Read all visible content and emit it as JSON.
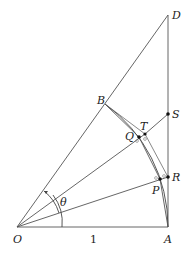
{
  "diagram": {
    "type": "geometry",
    "points": [
      {
        "name": "O",
        "label": "O",
        "x": 17,
        "y": 227
      },
      {
        "name": "A",
        "label": "A",
        "x": 168,
        "y": 227
      },
      {
        "name": "D",
        "label": "D",
        "x": 168,
        "y": 15
      },
      {
        "name": "B",
        "label": "B",
        "x": 105,
        "y": 104
      },
      {
        "name": "S",
        "label": "S",
        "x": 168,
        "y": 114
      },
      {
        "name": "R",
        "label": "R",
        "x": 168,
        "y": 177
      },
      {
        "name": "Q",
        "label": "Q",
        "x": 139,
        "y": 137
      },
      {
        "name": "T",
        "label": "T",
        "x": 145,
        "y": 134
      },
      {
        "name": "P",
        "label": "P",
        "x": 160,
        "y": 179
      }
    ],
    "labels": {
      "O": "O",
      "A": "A",
      "B": "B",
      "D": "D",
      "S": "S",
      "R": "R",
      "Q": "Q",
      "T": "T",
      "P": "P",
      "theta": "θ",
      "radius": "1"
    },
    "colors": {
      "line": "#555555",
      "text": "#222222",
      "background": "#ffffff"
    }
  }
}
